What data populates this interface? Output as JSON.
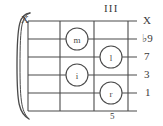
{
  "diagram": {
    "type": "guitar-chord-fretboard",
    "position_label": "III",
    "fret_number_label": "5",
    "mute_marker": "X",
    "barre_indicator": "curved-brace",
    "strings": 6,
    "frets": 3,
    "string_labels": [
      {
        "id": "string-1",
        "label": "X"
      },
      {
        "id": "string-2",
        "label": "♭9"
      },
      {
        "id": "string-3",
        "label": "7"
      },
      {
        "id": "string-4",
        "label": "3"
      },
      {
        "id": "string-5",
        "label": "1"
      }
    ],
    "finger_dots": [
      {
        "id": "dot-m",
        "label": "m",
        "string": 2,
        "fret": 1,
        "cx": 77,
        "cy": 39,
        "r": 11
      },
      {
        "id": "dot-l",
        "label": "l",
        "string": 3,
        "fret": 2,
        "cx": 111,
        "cy": 57,
        "r": 11
      },
      {
        "id": "dot-i",
        "label": "i",
        "string": 4,
        "fret": 1,
        "cx": 77,
        "cy": 75,
        "r": 11
      },
      {
        "id": "dot-r",
        "label": "r",
        "string": 5,
        "fret": 2,
        "cx": 111,
        "cy": 93,
        "r": 11
      }
    ],
    "colors": {
      "line": "#4a4a4a",
      "text": "#3a3a3a",
      "background": "#ffffff"
    }
  }
}
